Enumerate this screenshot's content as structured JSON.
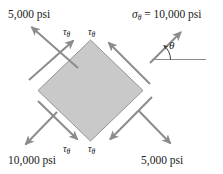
{
  "figure": {
    "shape": {
      "name": "rotated-square-element",
      "fill_color": "#c9c9c9",
      "stroke_color": "#8a8a8a",
      "vertices": {
        "top": [
          90.5,
          40
        ],
        "right": [
          143,
          90.5
        ],
        "bottom": [
          90.5,
          141
        ],
        "left": [
          38,
          90.5
        ]
      }
    },
    "arrow_color": "#8c8c8c",
    "labels": {
      "top_left_normal": "5,000 psi",
      "bottom_left_normal": "10,000 psi",
      "bottom_right_normal": "5,000 psi",
      "sigma_symbol": "σ",
      "sigma_subscript": "θ",
      "sigma_equation_rest": " = 10,000 psi",
      "tau_symbol": "τ",
      "tau_subscript": "θ",
      "theta_symbol": "θ"
    },
    "tau_labels": [
      {
        "id": "tau-top-left",
        "x": 63,
        "y": 28
      },
      {
        "id": "tau-top-right",
        "x": 87,
        "y": 28
      },
      {
        "id": "tau-bottom-left",
        "x": 63,
        "y": 145
      },
      {
        "id": "tau-bottom-right",
        "x": 87,
        "y": 145
      }
    ],
    "psi_labels": [
      {
        "id": "psi-top-left",
        "text": "5,000 psi",
        "x": 8,
        "y": 9
      },
      {
        "id": "psi-bottom-left",
        "text": "10,000 psi",
        "x": 8,
        "y": 155
      },
      {
        "id": "psi-bottom-right",
        "text": "5,000 psi",
        "x": 142,
        "y": 155
      }
    ],
    "sigma_label_pos": {
      "x": 132,
      "y": 9
    },
    "theta_label_pos": {
      "x": 168,
      "y": 42
    },
    "arrows": [
      {
        "name": "normal-arrow-top-left",
        "x1": 78,
        "y1": 68,
        "x2": 29,
        "y2": 25
      },
      {
        "name": "shear-arrow-top-left-edge",
        "x1": 29,
        "y1": 80,
        "x2": 75,
        "y2": 39
      },
      {
        "name": "normal-arrow-top-right",
        "x1": 148,
        "y1": 64,
        "x2": 180,
        "y2": 32
      },
      {
        "name": "shear-arrow-top-right-edge",
        "x1": 148,
        "y1": 82,
        "x2": 107,
        "y2": 41
      },
      {
        "name": "normal-arrow-bottom-left",
        "x1": 56,
        "y1": 113,
        "x2": 24,
        "y2": 146
      },
      {
        "name": "shear-arrow-bottom-left-edge",
        "x1": 38,
        "y1": 100,
        "x2": 79,
        "y2": 141
      },
      {
        "name": "normal-arrow-bottom-right",
        "x1": 140,
        "y1": 112,
        "x2": 172,
        "y2": 145
      },
      {
        "name": "shear-arrow-bottom-right-edge",
        "x1": 152,
        "y1": 98,
        "x2": 108,
        "y2": 141
      }
    ],
    "angle_indicator": {
      "name": "theta-angle-arc",
      "vertex": [
        154,
        59
      ],
      "baseline_end": [
        205,
        59
      ],
      "ray_end": [
        186,
        26
      ],
      "arc_radius": 17
    }
  }
}
